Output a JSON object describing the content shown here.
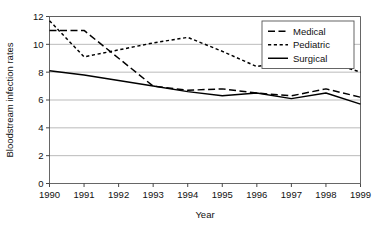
{
  "chart_data": {
    "type": "line",
    "title": "",
    "xlabel": "Year",
    "ylabel": "Bloodstream infection rates",
    "categories": [
      "1990",
      "1991",
      "1992",
      "1993",
      "1994",
      "1995",
      "1996",
      "1997",
      "1998",
      "1999"
    ],
    "x": [
      1990,
      1991,
      1992,
      1993,
      1994,
      1995,
      1996,
      1997,
      1998,
      1999
    ],
    "xlim": [
      1990,
      1999
    ],
    "ylim": [
      0,
      12
    ],
    "yticks": [
      0,
      2,
      4,
      6,
      8,
      10,
      12
    ],
    "ytick_labels": [
      "0",
      "2",
      "4",
      "6",
      "8",
      "10",
      "12"
    ],
    "xtick_labels": [
      "1990",
      "1991",
      "1992",
      "1993",
      "1994",
      "1995",
      "1996",
      "1997",
      "1998",
      "1999"
    ],
    "grid": "horizontal",
    "legend_position": "top-right",
    "series": [
      {
        "name": "Medical",
        "style": "long-dash",
        "color": "#000000",
        "values": [
          11.0,
          11.0,
          9.0,
          7.0,
          6.7,
          6.8,
          6.5,
          6.3,
          6.8,
          6.2
        ]
      },
      {
        "name": "Pediatric",
        "style": "short-dash",
        "color": "#000000",
        "values": [
          11.7,
          9.1,
          9.6,
          10.1,
          10.5,
          9.5,
          8.4,
          8.9,
          8.8,
          8.0
        ]
      },
      {
        "name": "Surgical",
        "style": "solid",
        "color": "#000000",
        "values": [
          8.1,
          7.8,
          7.4,
          7.0,
          6.6,
          6.3,
          6.5,
          6.1,
          6.5,
          5.7
        ]
      }
    ]
  },
  "legend": {
    "items": [
      {
        "label": "Medical"
      },
      {
        "label": "Pediatric"
      },
      {
        "label": "Surgical"
      }
    ]
  },
  "axes": {
    "x_title": "Year",
    "y_title": "Bloodstream infection rates"
  }
}
